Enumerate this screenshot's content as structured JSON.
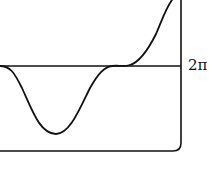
{
  "diagram": {
    "type": "function-curve",
    "labels": {
      "level": "2π"
    },
    "stroke_color": "#111111",
    "background": "#ffffff"
  }
}
